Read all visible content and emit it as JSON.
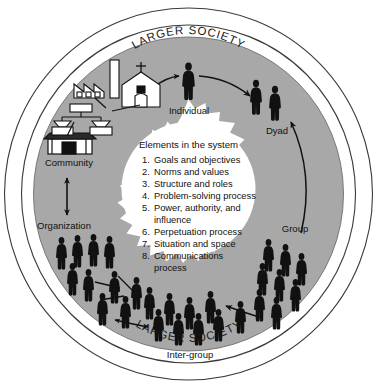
{
  "diagram": {
    "title_text": "Elements in the system",
    "outer_ring_label_top": "LARGER SOCIETY",
    "outer_ring_label_bottom": "LARGER SOCIETY",
    "colors": {
      "ring_gray": "#a8a8a8",
      "background": "#ffffff",
      "outline": "#3a3a3a",
      "figure": "#111111",
      "text": "#111111"
    },
    "center": {
      "heading": "Elements in the system",
      "items": [
        {
          "num": "1.",
          "text": "Goals and objectives"
        },
        {
          "num": "2.",
          "text": "Norms and values"
        },
        {
          "num": "3.",
          "text": "Structure and roles"
        },
        {
          "num": "4.",
          "text": "Problem-solving process"
        },
        {
          "num": "5.",
          "text": "Power, authority, and"
        },
        {
          "num": "",
          "text": "influence"
        },
        {
          "num": "6.",
          "text": "Perpetuation process"
        },
        {
          "num": "7.",
          "text": "Situation and space"
        },
        {
          "num": "8.",
          "text": "Communications"
        },
        {
          "num": "",
          "text": "process"
        }
      ]
    },
    "stages": [
      {
        "id": "individual",
        "label": "Individual"
      },
      {
        "id": "dyad",
        "label": "Dyad"
      },
      {
        "id": "group",
        "label": "Group"
      },
      {
        "id": "inter-group",
        "label": "Inter-group"
      },
      {
        "id": "organization",
        "label": "Organization"
      },
      {
        "id": "community",
        "label": "Community"
      }
    ],
    "icons": {
      "factory": "factory-icon",
      "church": "church-icon",
      "org_chart": "org-chart-icon",
      "civic_building": "civic-building-icon",
      "person": "person-silhouette-icon"
    }
  }
}
